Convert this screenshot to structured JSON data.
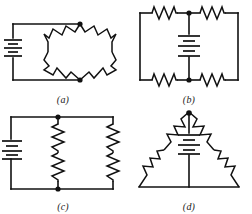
{
  "figure": {
    "background_color": "#ffffff",
    "line_color": "#111111",
    "panel_count": 4
  },
  "panels": [
    {
      "id": "panel-a",
      "label": "(a)",
      "topology": "bridge",
      "description": "Battery on the left side of a loop feeding a diamond-shaped bridge of four resistors",
      "source_count": 1,
      "resistor_count": 4,
      "node_dot_count": 2,
      "sources": [
        {
          "name": "battery-a",
          "symbol": "battery",
          "orientation": "vertical",
          "plate_pairs": 3
        }
      ],
      "resistors": [
        {
          "name": "resistor-a-top-left",
          "orientation": "diagonal"
        },
        {
          "name": "resistor-a-top-right",
          "orientation": "diagonal"
        },
        {
          "name": "resistor-a-bottom-left",
          "orientation": "diagonal"
        },
        {
          "name": "resistor-a-bottom-right",
          "orientation": "diagonal"
        }
      ]
    },
    {
      "id": "panel-b",
      "label": "(b)",
      "topology": "bridge-rectangular",
      "description": "Rectangular loop with two resistors on the top rail and two on the bottom rail, battery in the centre branch",
      "source_count": 1,
      "resistor_count": 4,
      "node_dot_count": 2,
      "sources": [
        {
          "name": "battery-b",
          "symbol": "battery",
          "orientation": "vertical",
          "plate_pairs": 3
        }
      ],
      "resistors": [
        {
          "name": "resistor-b-top-left",
          "orientation": "horizontal"
        },
        {
          "name": "resistor-b-top-right",
          "orientation": "horizontal"
        },
        {
          "name": "resistor-b-bottom-left",
          "orientation": "horizontal"
        },
        {
          "name": "resistor-b-bottom-right",
          "orientation": "horizontal"
        }
      ]
    },
    {
      "id": "panel-c",
      "label": "(c)",
      "topology": "parallel-branches",
      "description": "Battery on the left with two parallel vertical branches, each holding two resistors in series",
      "source_count": 1,
      "resistor_count": 4,
      "node_dot_count": 2,
      "sources": [
        {
          "name": "battery-c",
          "symbol": "battery",
          "orientation": "vertical",
          "plate_pairs": 3
        }
      ],
      "resistors": [
        {
          "name": "resistor-c-middle-upper",
          "orientation": "vertical"
        },
        {
          "name": "resistor-c-middle-lower",
          "orientation": "vertical"
        },
        {
          "name": "resistor-c-right-upper",
          "orientation": "vertical"
        },
        {
          "name": "resistor-c-right-lower",
          "orientation": "vertical"
        }
      ]
    },
    {
      "id": "panel-d",
      "label": "(d)",
      "topology": "delta",
      "description": "Triangular delta network with resistors along both slanted sides and a battery in the vertical centre branch from the apex",
      "source_count": 1,
      "resistor_count": 4,
      "node_dot_count": 1,
      "sources": [
        {
          "name": "battery-d",
          "symbol": "battery",
          "orientation": "vertical",
          "plate_pairs": 3
        }
      ],
      "resistors": [
        {
          "name": "resistor-d-left-upper",
          "orientation": "diagonal"
        },
        {
          "name": "resistor-d-left-lower",
          "orientation": "diagonal"
        },
        {
          "name": "resistor-d-right-upper",
          "orientation": "diagonal"
        },
        {
          "name": "resistor-d-right-lower",
          "orientation": "diagonal"
        }
      ]
    }
  ]
}
